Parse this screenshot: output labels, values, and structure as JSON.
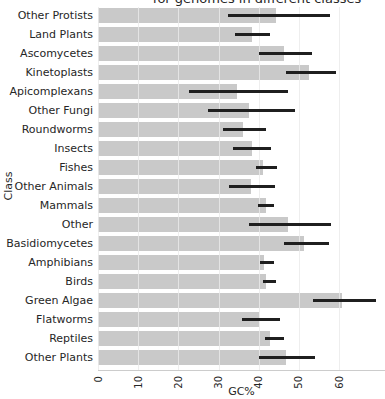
{
  "title_visible": "for genomes in different classes",
  "axis": {
    "xlabel": "GC%",
    "ylabel": "Class",
    "x_tick_labels": [
      "0",
      "10",
      "20",
      "30",
      "40",
      "50",
      "60"
    ]
  },
  "colors": {
    "bar": "#c9c9c9",
    "error_bar": "#1f1f1f",
    "gridline": "#dcdcdc",
    "axis_spine": "#cccccc",
    "text": "#262626",
    "background": "#ffffff"
  },
  "chart_data": {
    "type": "bar",
    "orientation": "horizontal",
    "title": "for genomes in different classes",
    "xlabel": "GC%",
    "ylabel": "Class",
    "xlim": [
      0,
      71.5
    ],
    "grid": true,
    "legend": false,
    "x_ticks": [
      0,
      10,
      20,
      30,
      40,
      50,
      60
    ],
    "categories": [
      "Other Protists",
      "Land Plants",
      "Ascomycetes",
      "Kinetoplasts",
      "Apicomplexans",
      "Other Fungi",
      "Roundworms",
      "Insects",
      "Fishes",
      "Other Animals",
      "Mammals",
      "Other",
      "Basidiomycetes",
      "Amphibians",
      "Birds",
      "Green Algae",
      "Flatworms",
      "Reptiles",
      "Other Plants"
    ],
    "values": [
      44.4,
      38.3,
      46.4,
      52.6,
      34.7,
      37.6,
      36.2,
      38.3,
      41.2,
      38.1,
      41.8,
      47.4,
      51.3,
      41.4,
      41.8,
      60.8,
      40.0,
      42.9,
      46.9
    ],
    "error_low": [
      32.3,
      34.2,
      40.2,
      46.8,
      22.7,
      27.3,
      31.0,
      33.5,
      39.3,
      32.5,
      39.8,
      37.7,
      46.4,
      40.4,
      41.0,
      53.5,
      35.8,
      41.7,
      40.2
    ],
    "error_high": [
      57.8,
      42.8,
      53.4,
      59.3,
      47.3,
      49.0,
      41.8,
      43.0,
      44.5,
      44.1,
      43.9,
      58.0,
      57.6,
      43.8,
      44.2,
      69.3,
      45.3,
      46.3,
      54.1
    ]
  }
}
